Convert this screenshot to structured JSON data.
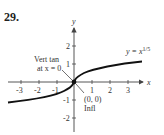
{
  "problem_number": "29.",
  "axes": {
    "x_label": "x",
    "y_label": "y",
    "x_ticks": [
      "-3",
      "-2",
      "-1",
      "1",
      "2",
      "3"
    ],
    "y_ticks": [
      "2",
      "1",
      "-1",
      "-2"
    ]
  },
  "curve": {
    "label_prefix": "y = x",
    "label_exponent": "1/5"
  },
  "annotations": {
    "vert_tan_line1": "Vert tan",
    "vert_tan_line2": "at x = 0",
    "point_label": "(0, 0)",
    "point_note": "Infl"
  },
  "colors": {
    "curve": "#111111",
    "axis": "#444444",
    "text": "#333333"
  }
}
